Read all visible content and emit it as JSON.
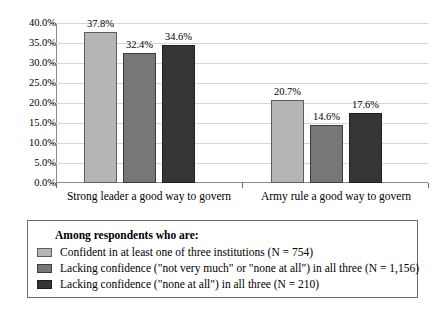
{
  "chart_data": {
    "type": "bar",
    "title": "",
    "xlabel": "",
    "ylabel": "",
    "ylim": [
      0,
      40
    ],
    "ytick_labels": [
      "0.0%",
      "5.0%",
      "10.0%",
      "15.0%",
      "20.0%",
      "25.0%",
      "30.0%",
      "35.0%",
      "40.0%"
    ],
    "ytick_values": [
      0,
      5,
      10,
      15,
      20,
      25,
      30,
      35,
      40
    ],
    "grid": true,
    "legend_position": "below",
    "categories": [
      "Strong leader a good way to govern",
      "Army rule a good way to govern"
    ],
    "series": [
      {
        "name": "Confident in at least one of three institutions (N = 754)",
        "color": "#b5b5b5",
        "values": [
          37.8,
          20.7
        ],
        "labels": [
          "37.8%",
          "20.7%"
        ]
      },
      {
        "name": "Lacking confidence (\"not very much\" or \"none at all\") in all three (N = 1,156)",
        "color": "#777777",
        "values": [
          32.4,
          14.6
        ],
        "labels": [
          "32.4%",
          "14.6%"
        ]
      },
      {
        "name": "Lacking confidence (\"none at all\") in all three (N = 210)",
        "color": "#353535",
        "values": [
          34.6,
          17.6
        ],
        "labels": [
          "34.6%",
          "17.6%"
        ]
      }
    ]
  },
  "legend": {
    "title": "Among respondents who are:",
    "items": [
      {
        "label": "Confident in at least one of three institutions (N = 754)",
        "color": "#b5b5b5"
      },
      {
        "label": "Lacking confidence (\"not very much\" or \"none at all\") in all three (N = 1,156)",
        "color": "#777777"
      },
      {
        "label": "Lacking confidence (\"none at all\") in all three (N = 210)",
        "color": "#353535"
      }
    ]
  }
}
